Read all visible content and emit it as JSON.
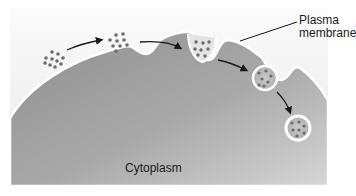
{
  "diagram": {
    "type": "endocytosis illustration",
    "labels": {
      "plasma_membrane_line1": "Plasma",
      "plasma_membrane_line2": "membrane",
      "cytoplasm": "Cytoplasm"
    },
    "stages": [
      {
        "name": "extracellular particles",
        "x": 55,
        "y": 60
      },
      {
        "name": "particles at membrane",
        "x": 115,
        "y": 42
      },
      {
        "name": "membrane invagination",
        "x": 200,
        "y": 47
      },
      {
        "name": "budding vesicle",
        "x": 265,
        "y": 77
      },
      {
        "name": "internalized vesicle",
        "x": 298,
        "y": 128
      }
    ],
    "colors": {
      "background_top": "#f4f4f4",
      "cytoplasm_light": "#d8d8d8",
      "cytoplasm_dark": "#8e8e8e",
      "membrane": "#ffffff",
      "particle": "#6a6a6a",
      "arrow": "#1a1a1a"
    }
  }
}
